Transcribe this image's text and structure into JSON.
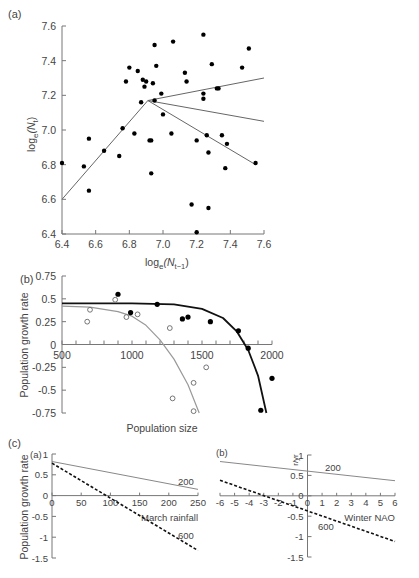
{
  "chart_data": [
    {
      "panel": "(a)",
      "type": "scatter",
      "xlabel": "log_e(N_t-1)",
      "ylabel": "log_e(N_t)",
      "xlim": [
        6.4,
        7.6
      ],
      "ylim": [
        6.4,
        7.6
      ],
      "xticks": [
        "6.4",
        "6.6",
        "6.8",
        "7.0",
        "7.2",
        "7.4",
        "7.6"
      ],
      "yticks": [
        "6.4",
        "6.6",
        "6.8",
        "7.0",
        "7.2",
        "7.4",
        "7.6"
      ],
      "grid": false,
      "points": [
        [
          6.4,
          6.81
        ],
        [
          6.53,
          6.79
        ],
        [
          6.56,
          6.95
        ],
        [
          6.56,
          6.65
        ],
        [
          6.65,
          6.88
        ],
        [
          6.74,
          6.85
        ],
        [
          6.76,
          7.01
        ],
        [
          6.78,
          7.28
        ],
        [
          6.8,
          7.36
        ],
        [
          6.83,
          6.98
        ],
        [
          6.85,
          7.34
        ],
        [
          6.87,
          7.16
        ],
        [
          6.88,
          7.29
        ],
        [
          6.89,
          7.25
        ],
        [
          6.9,
          7.28
        ],
        [
          6.92,
          6.94
        ],
        [
          6.93,
          6.94
        ],
        [
          6.93,
          6.75
        ],
        [
          6.94,
          7.27
        ],
        [
          6.95,
          7.49
        ],
        [
          6.95,
          7.17
        ],
        [
          6.96,
          7.37
        ],
        [
          6.99,
          7.21
        ],
        [
          7.0,
          7.09
        ],
        [
          7.06,
          7.51
        ],
        [
          7.05,
          6.98
        ],
        [
          7.13,
          7.33
        ],
        [
          7.14,
          7.28
        ],
        [
          7.17,
          6.57
        ],
        [
          7.2,
          6.94
        ],
        [
          7.2,
          6.41
        ],
        [
          7.24,
          7.55
        ],
        [
          7.24,
          7.18
        ],
        [
          7.24,
          7.21
        ],
        [
          7.26,
          6.97
        ],
        [
          7.27,
          6.87
        ],
        [
          7.27,
          6.55
        ],
        [
          7.29,
          7.38
        ],
        [
          7.32,
          7.24
        ],
        [
          7.33,
          7.24
        ],
        [
          7.35,
          6.97
        ],
        [
          7.37,
          6.78
        ],
        [
          7.38,
          6.92
        ],
        [
          7.47,
          7.36
        ],
        [
          7.51,
          7.47
        ],
        [
          7.55,
          6.81
        ]
      ],
      "lines": [
        {
          "name": "rising segment",
          "points": [
            [
              6.4,
              6.6
            ],
            [
              6.91,
              7.17
            ]
          ]
        },
        {
          "name": "upper branch",
          "points": [
            [
              6.91,
              7.17
            ],
            [
              7.6,
              7.3
            ]
          ]
        },
        {
          "name": "middle branch",
          "points": [
            [
              6.91,
              7.17
            ],
            [
              7.6,
              7.05
            ]
          ]
        },
        {
          "name": "lower branch",
          "points": [
            [
              6.91,
              7.17
            ],
            [
              7.55,
              6.8
            ]
          ]
        }
      ]
    },
    {
      "panel": "(b)",
      "type": "scatter",
      "xlabel": "Population size",
      "ylabel": "Population growth rate",
      "xlim": [
        500,
        2000
      ],
      "ylim": [
        -0.75,
        0.75
      ],
      "xticks": [
        "500",
        "1000",
        "1500",
        "2000"
      ],
      "yticks": [
        "0.75",
        "0.5",
        "0.25",
        "0",
        "-0.25",
        "-0.5",
        "-0.75"
      ],
      "grid": false,
      "series": [
        {
          "name": "filled points",
          "marker": "filled",
          "color": "#000000",
          "points": [
            [
              900,
              0.55
            ],
            [
              990,
              0.35
            ],
            [
              1180,
              0.44
            ],
            [
              1360,
              0.28
            ],
            [
              1400,
              0.3
            ],
            [
              1560,
              0.25
            ],
            [
              1760,
              0.15
            ],
            [
              1830,
              -0.04
            ],
            [
              2000,
              -0.37
            ],
            [
              1920,
              -0.72
            ]
          ]
        },
        {
          "name": "open points",
          "marker": "open",
          "color": "#555555",
          "points": [
            [
              680,
              0.25
            ],
            [
              700,
              0.38
            ],
            [
              880,
              0.49
            ],
            [
              960,
              0.3
            ],
            [
              1040,
              0.33
            ],
            [
              1270,
              0.18
            ],
            [
              1290,
              -0.59
            ],
            [
              1440,
              -0.42
            ],
            [
              1440,
              -0.73
            ],
            [
              1530,
              -0.25
            ]
          ]
        }
      ],
      "curves": [
        {
          "name": "black fit",
          "color": "#111111",
          "points": [
            [
              500,
              0.45
            ],
            [
              1000,
              0.45
            ],
            [
              1300,
              0.44
            ],
            [
              1500,
              0.39
            ],
            [
              1650,
              0.29
            ],
            [
              1750,
              0.14
            ],
            [
              1830,
              -0.06
            ],
            [
              1900,
              -0.34
            ],
            [
              1960,
              -0.75
            ]
          ]
        },
        {
          "name": "gray fit",
          "color": "#999999",
          "points": [
            [
              500,
              0.42
            ],
            [
              700,
              0.41
            ],
            [
              900,
              0.36
            ],
            [
              1000,
              0.31
            ],
            [
              1100,
              0.21
            ],
            [
              1200,
              0.05
            ],
            [
              1300,
              -0.16
            ],
            [
              1400,
              -0.44
            ],
            [
              1480,
              -0.75
            ]
          ]
        }
      ]
    },
    {
      "panel": "(c)(a)",
      "type": "line",
      "xlabel": "March rainfall",
      "ylabel": "Population growth rate",
      "xlim": [
        0,
        250
      ],
      "ylim": [
        -1.5,
        1
      ],
      "xticks": [
        "0",
        "50",
        "100",
        "150",
        "200",
        "250"
      ],
      "yticks": [
        "1",
        "0.5",
        "0",
        "-0.5",
        "-1",
        "-1.5"
      ],
      "grid": false,
      "series": [
        {
          "name": "200",
          "style": "solid",
          "color": "#888888",
          "points": [
            [
              0,
              0.82
            ],
            [
              250,
              0.15
            ]
          ]
        },
        {
          "name": "600",
          "style": "dashed",
          "color": "#111111",
          "points": [
            [
              0,
              0.78
            ],
            [
              250,
              -1.32
            ]
          ]
        }
      ]
    },
    {
      "panel": "(c)(b)",
      "type": "line",
      "xlabel": "Winter NAO",
      "ylabel": "r/yr",
      "xlim": [
        -6,
        6
      ],
      "ylim": [
        -1.5,
        1
      ],
      "xticks": [
        "-6",
        "-5",
        "-4",
        "-3",
        "-2",
        "-1",
        "0",
        "1",
        "2",
        "3",
        "4",
        "5",
        "6"
      ],
      "yticks": [
        "1",
        "0.5",
        "0",
        "-0.5",
        "-1",
        "-1.5"
      ],
      "grid": false,
      "series": [
        {
          "name": "200",
          "style": "solid",
          "color": "#888888",
          "points": [
            [
              -6,
              0.84
            ],
            [
              6,
              0.37
            ]
          ]
        },
        {
          "name": "600",
          "style": "dashed",
          "color": "#111111",
          "points": [
            [
              -6,
              0.38
            ],
            [
              6,
              -1.12
            ]
          ]
        }
      ]
    }
  ],
  "labels": {
    "panel_a": "(a)",
    "panel_b": "(b)",
    "panel_c": "(c)",
    "panel_ca": "(a)",
    "panel_cb": "(b)",
    "a_xlabel_main": "log",
    "a_xlabel_sub": "e",
    "a_xlabel_paren": "(N",
    "a_xlabel_tsub": "t−1",
    "a_xlabel_close": ")",
    "a_ylabel_main": "log",
    "a_ylabel_sub": "e",
    "a_ylabel_paren": "(N",
    "a_ylabel_tsub": "t",
    "a_ylabel_close": ")",
    "b_xlabel": "Population size",
    "b_ylabel": "Population growth rate",
    "c_ylabel": "Population growth rate",
    "ca_xlabel": "March rainfall",
    "cb_xlabel": "Winter NAO",
    "cb_ylabel": "r/yr",
    "line_200": "200",
    "line_600": "600"
  }
}
